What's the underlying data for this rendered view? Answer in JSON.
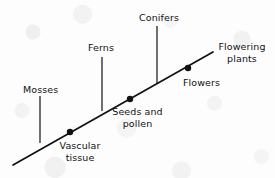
{
  "diagram": {
    "type": "evolutionary-trend-line-diagram",
    "title": "",
    "background_color": "#fdfdfd",
    "ink_color": "#111111",
    "main_axis": {
      "name": "evolutionary-trend-line",
      "from": [
        13,
        165
      ],
      "to": [
        213,
        52
      ],
      "stroke_width": 1.6
    },
    "branches": [
      {
        "id": "mosses",
        "label": "Mosses",
        "line_x": 40,
        "line_top_y": 96,
        "line_bottom_y": 143,
        "label_x": 23,
        "label_y": 84
      },
      {
        "id": "ferns",
        "label": "Ferns",
        "line_x": 102,
        "line_top_y": 57,
        "line_bottom_y": 111,
        "label_x": 88,
        "label_y": 42
      },
      {
        "id": "conifers",
        "label": "Conifers",
        "line_x": 157,
        "line_top_y": 26,
        "line_bottom_y": 84,
        "label_x": 139,
        "label_y": 12
      }
    ],
    "nodes": [
      {
        "id": "vascular-tissue",
        "label": "Vascular\ntissue",
        "dot_x": 70,
        "dot_y": 132,
        "dot_r": 3.1,
        "label_x": 55,
        "label_y": 140
      },
      {
        "id": "seeds-and-pollen",
        "label": "Seeds and\npollen",
        "dot_x": 130,
        "dot_y": 99,
        "dot_r": 3.1,
        "label_x": 110,
        "label_y": 106
      },
      {
        "id": "flowers",
        "label": "Flowers",
        "dot_x": 188,
        "dot_y": 68,
        "dot_r": 3.1,
        "label_x": 183,
        "label_y": 77
      }
    ],
    "terminal": {
      "id": "flowering-plants",
      "label": "Flowering\nplants",
      "label_x": 214,
      "label_y": 41
    }
  }
}
